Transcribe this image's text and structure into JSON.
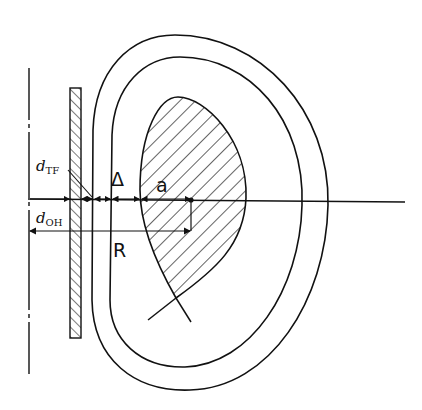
{
  "diagram": {
    "labels": {
      "d_tf_main": "d",
      "d_tf_sub": "TF",
      "d_oh_main": "d",
      "d_oh_sub": "OH",
      "delta": "Δ",
      "a": "a",
      "R": "R"
    },
    "components": [
      {
        "name": "axis-of-symmetry",
        "style": "dash-dot"
      },
      {
        "name": "oh-solenoid",
        "style": "hatched-rectangle"
      },
      {
        "name": "tf-coil-outer",
        "style": "D-shaped outline"
      },
      {
        "name": "tf-coil-inner",
        "style": "D-shaped outline"
      },
      {
        "name": "plasma",
        "style": "hatched with lower X-point"
      },
      {
        "name": "midplane",
        "style": "solid line"
      }
    ],
    "colors": {
      "line": "#111111",
      "background": "#ffffff"
    }
  }
}
